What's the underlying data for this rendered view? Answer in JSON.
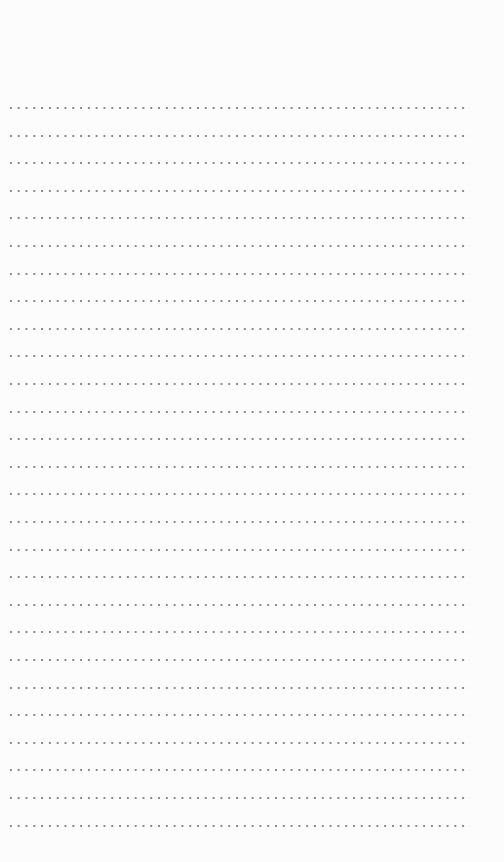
{
  "page": {
    "type": "dotted-ruled-sheet",
    "line_count": 27,
    "first_line_y": 108,
    "line_spacing": 27.6,
    "dot_color": "#8a8a8a",
    "background_color": "#fcfcfc",
    "lines": []
  }
}
